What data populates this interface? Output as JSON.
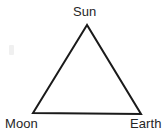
{
  "diagram": {
    "type": "triangle-relationship-diagram",
    "background_color": "#ffffff",
    "stroke_color": "#1a1a1a",
    "stroke_width": 2,
    "text_color": "#262626",
    "font_size_px": 13,
    "canvas": {
      "width": 168,
      "height": 137
    },
    "vertices": [
      {
        "id": "sun",
        "label": "Sun",
        "x": 87,
        "y": 25,
        "label_x": 73,
        "label_y": 5,
        "position": "apex"
      },
      {
        "id": "moon",
        "label": "Moon",
        "x": 33,
        "y": 113,
        "label_x": 5,
        "label_y": 117,
        "position": "bottom-left"
      },
      {
        "id": "earth",
        "label": "Earth",
        "x": 141,
        "y": 114,
        "label_x": 130,
        "label_y": 117,
        "position": "bottom-right"
      }
    ],
    "edges": [
      {
        "id": "sun-moon",
        "from": "sun",
        "to": "moon"
      },
      {
        "id": "moon-earth",
        "from": "moon",
        "to": "earth"
      },
      {
        "id": "earth-sun",
        "from": "earth",
        "to": "sun"
      }
    ],
    "path": "M 87 25 L 33 113 L 141 114 Z",
    "artifact": {
      "id": "scan-smudge",
      "x": 9,
      "y": 45,
      "width": 5,
      "height": 10,
      "color": "#f0f0f0"
    }
  },
  "labels": {
    "sun": "Sun",
    "moon": "Moon",
    "earth": "Earth"
  }
}
